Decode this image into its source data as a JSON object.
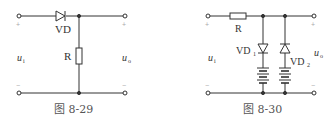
{
  "figures": [
    {
      "id": "fig-8-29",
      "caption": "图 8-29",
      "labels": {
        "diode": "VD",
        "resistor": "R",
        "input": "u",
        "input_sub": "i",
        "output": "u",
        "output_sub": "o",
        "plus": "+",
        "minus": "−"
      }
    },
    {
      "id": "fig-8-30",
      "caption": "图 8-30",
      "labels": {
        "resistor": "R",
        "diode1": "VD",
        "diode1_sub": "1",
        "diode2": "VD",
        "diode2_sub": "2",
        "input": "u",
        "input_sub": "i",
        "output": "u",
        "output_sub": "o",
        "plus": "+",
        "minus": "−"
      }
    }
  ],
  "colors": {
    "wire": "#333333",
    "text": "#333333",
    "caption": "#555555",
    "polarity": "#aaaaaa"
  }
}
